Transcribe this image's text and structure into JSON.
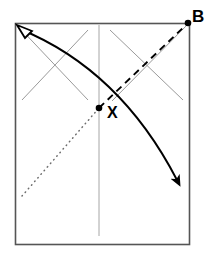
{
  "figure": {
    "type": "origami-fold-diagram",
    "background_color": "#ffffff",
    "canvas": {
      "width": 205,
      "height": 256
    }
  },
  "labels": {
    "corner_b": "B",
    "point_x": "X"
  },
  "colors": {
    "paper_outline": "#555555",
    "crease_gray": "#9a9a9a",
    "fold_line_black": "#000000",
    "arrow_black": "#000000",
    "label_black": "#000000",
    "paper_fill": "#ffffff"
  },
  "geometry": {
    "paper_rect": {
      "x": 15,
      "y": 23,
      "width": 175,
      "height": 222
    },
    "center_vertical_line": {
      "x": 99,
      "y1": 25,
      "y2": 236
    },
    "crease_lines_gray": [
      {
        "name": "left-crease-down",
        "x1": 16,
        "y1": 24,
        "x2": 88,
        "y2": 100
      },
      {
        "name": "left-crease-up",
        "x1": 22,
        "y1": 100,
        "x2": 88,
        "y2": 30
      },
      {
        "name": "right-crease-down",
        "x1": 110,
        "y1": 30,
        "x2": 183,
        "y2": 100
      },
      {
        "name": "right-crease-up",
        "x1": 112,
        "y1": 100,
        "x2": 188,
        "y2": 24
      }
    ],
    "dotted_line": {
      "x1": 22,
      "y1": 196,
      "x2": 99,
      "y2": 108
    },
    "dashed_line": {
      "x1": 99,
      "y1": 108,
      "x2": 188,
      "y2": 24
    },
    "marked_point_x": {
      "cx": 99,
      "cy": 108,
      "r": 3.2
    },
    "marked_point_b": {
      "cx": 188,
      "cy": 23,
      "r": 3.2
    },
    "fold_arrow_curve": {
      "start": {
        "x": 20,
        "y": 29
      },
      "control": {
        "x": 120,
        "y": 70
      },
      "end": {
        "x": 177,
        "y": 180
      }
    },
    "label_positions": {
      "corner_b": {
        "x": 192,
        "y": 17
      },
      "point_x": {
        "x": 108,
        "y": 116
      }
    }
  },
  "annotations": {
    "open_arrowhead": "unfilled-triangle-pointing-upper-left",
    "closed_arrowhead": "filled-triangle-pointing-lower-right"
  }
}
